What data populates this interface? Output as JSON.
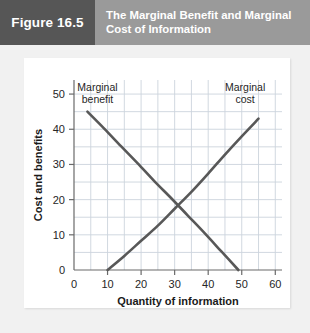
{
  "header": {
    "figure_number": "Figure 16.5",
    "title": "The Marginal Benefit and Marginal Cost of Information",
    "title_line_1": "The Marginal Benefit and Marginal",
    "title_line_2": "Cost of Information",
    "number_block_color": "#565656",
    "band_color": "#9a9a9a",
    "text_color": "#ffffff"
  },
  "chart_data": {
    "type": "line",
    "title": "The Marginal Benefit and Marginal Cost of Information",
    "xlabel": "Quantity of information",
    "ylabel": "Cost and benefits",
    "xlim": [
      0,
      62
    ],
    "ylim": [
      0,
      54
    ],
    "xticks": [
      0,
      10,
      20,
      30,
      40,
      50,
      60
    ],
    "xtick_labels": [
      "0",
      "10",
      "20",
      "30",
      "40",
      "50",
      "60"
    ],
    "yticks": [
      0,
      10,
      20,
      30,
      40,
      50
    ],
    "ytick_labels": [
      "0",
      "10",
      "20",
      "30",
      "40",
      "50"
    ],
    "grid": true,
    "grid_step_x": 5,
    "grid_step_y": 5,
    "grid_color": "#ccd4dd",
    "legend_position": "inline-annotations",
    "curve_color": "#585858",
    "curve_width": 2.6,
    "series": [
      {
        "name": "Marginal benefit",
        "label_line_1": "Marginal",
        "label_line_2": "benefit",
        "label_x": 7,
        "label_y": 51,
        "x": [
          4,
          9,
          14,
          19,
          24,
          29,
          34,
          39,
          44,
          49
        ],
        "y": [
          45,
          40.2,
          35.2,
          30.3,
          25.2,
          20.4,
          15.4,
          10.4,
          5.2,
          0
        ]
      },
      {
        "name": "Marginal cost",
        "label_line_1": "Marginal",
        "label_line_2": "cost",
        "label_x": 51,
        "label_y": 51,
        "x": [
          10,
          15,
          20,
          25,
          30,
          35,
          40,
          45,
          50,
          55
        ],
        "y": [
          0,
          4.0,
          8.3,
          12.6,
          17.4,
          22.2,
          27.4,
          32.8,
          38.0,
          43.0
        ]
      }
    ],
    "intersection": {
      "x": 29,
      "y": 16.6
    }
  }
}
